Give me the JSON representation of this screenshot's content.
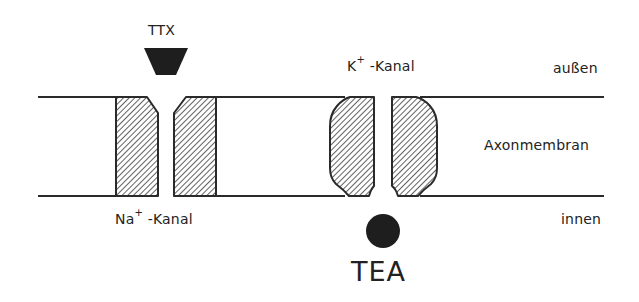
{
  "diagram": {
    "labels": {
      "toxin_top": "TTX",
      "k_channel_ion": "K",
      "k_channel_charge": "+",
      "k_channel_suffix": " -Kanal",
      "outside": "außen",
      "membrane": "Axonmembran",
      "inside": "innen",
      "na_channel_ion": "Na",
      "na_channel_charge": "+",
      "na_channel_suffix": " -Kanal",
      "toxin_bottom": "TEA"
    },
    "colors": {
      "line": "#2a2a2a",
      "fill_blocker": "#1e1e1e",
      "hatch": "#3a3a3a",
      "background": "#ffffff"
    }
  }
}
